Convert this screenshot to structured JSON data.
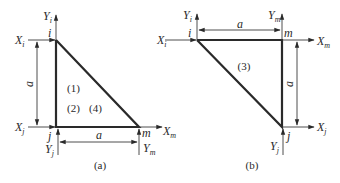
{
  "figure": {
    "panels": [
      {
        "id": "a",
        "caption": "(a)",
        "nodes": {
          "i": "i",
          "j": "j",
          "m": "m"
        },
        "forces": {
          "Xi": {
            "base": "X",
            "sub": "i"
          },
          "Yi": {
            "base": "Y",
            "sub": "i"
          },
          "Xj": {
            "base": "X",
            "sub": "j"
          },
          "Yj": {
            "base": "Y",
            "sub": "j"
          },
          "Xm": {
            "base": "X",
            "sub": "m"
          },
          "Ym": {
            "base": "Y",
            "sub": "m"
          }
        },
        "dimensions": {
          "vertical": "a",
          "horizontal": "a"
        },
        "element_labels": [
          "(1)",
          "(2)",
          "(4)"
        ]
      },
      {
        "id": "b",
        "caption": "(b)",
        "nodes": {
          "i": "i",
          "j": "j",
          "m": "m"
        },
        "forces": {
          "Xi": {
            "base": "X",
            "sub": "i"
          },
          "Yi": {
            "base": "Y",
            "sub": "i"
          },
          "Xj": {
            "base": "X",
            "sub": "j"
          },
          "Yj": {
            "base": "Y",
            "sub": "j"
          },
          "Xm": {
            "base": "X",
            "sub": "m"
          },
          "Ym": {
            "base": "Y",
            "sub": "m"
          }
        },
        "dimensions": {
          "horizontal": "a",
          "vertical": "a"
        },
        "element_labels": [
          "(3)"
        ]
      }
    ]
  }
}
